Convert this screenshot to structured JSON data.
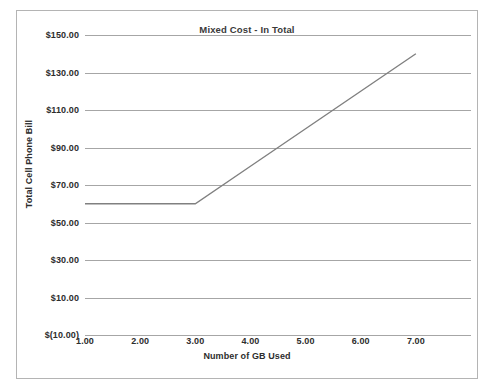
{
  "chart_data": {
    "type": "line",
    "title": "Mixed Cost - In Total",
    "xlabel": "Number of GB Used",
    "ylabel": "Total Cell Phone Bill",
    "x": [
      1.0,
      2.0,
      3.0,
      4.0,
      5.0,
      6.0,
      7.0
    ],
    "y": [
      60.0,
      60.0,
      60.0,
      80.0,
      100.0,
      120.0,
      140.0
    ],
    "series": [
      {
        "name": "Total Cell Phone Bill",
        "values": [
          60.0,
          60.0,
          60.0,
          80.0,
          100.0,
          120.0,
          140.0
        ],
        "color": "#808080"
      }
    ],
    "xlim": [
      1.0,
      8.0
    ],
    "ylim": [
      -10.0,
      150.0
    ],
    "xtick_values": [
      1.0,
      2.0,
      3.0,
      4.0,
      5.0,
      6.0,
      7.0
    ],
    "xtick_labels": [
      "1.00",
      "2.00",
      "3.00",
      "4.00",
      "5.00",
      "6.00",
      "7.00"
    ],
    "ytick_values": [
      150.0,
      130.0,
      110.0,
      90.0,
      70.0,
      50.0,
      30.0,
      10.0,
      -10.0
    ],
    "ytick_labels": [
      "$150.00",
      "$130.00",
      "$110.00",
      "$90.00",
      "$70.00",
      "$50.00",
      "$30.00",
      "$10.00",
      "$(10.00)"
    ],
    "grid": true,
    "grid_color": "#a6a6a6",
    "legend": false,
    "background": "#ffffff",
    "border_color": "#b4b4b4"
  }
}
